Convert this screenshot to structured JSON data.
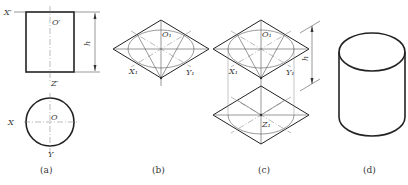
{
  "figure": {
    "colors": {
      "line": "#222222",
      "thin_line": "#555555",
      "background": "#ffffff"
    },
    "panels": [
      {
        "id": "a",
        "caption": "(a)",
        "labels": {
          "x_prime": "X′",
          "o_prime": "O′",
          "z_prime": "Z′",
          "height": "h",
          "x": "X",
          "o": "O",
          "y": "Y"
        }
      },
      {
        "id": "b",
        "caption": "(b)",
        "labels": {
          "o1": "O₁",
          "x1": "X₁",
          "y1": "Y₁"
        }
      },
      {
        "id": "c",
        "caption": "(c)",
        "labels": {
          "o1": "O₁",
          "x1": "X₁",
          "y1": "Y₁",
          "z1": "Z₁",
          "height": "h"
        }
      },
      {
        "id": "d",
        "caption": "(d)"
      }
    ]
  }
}
